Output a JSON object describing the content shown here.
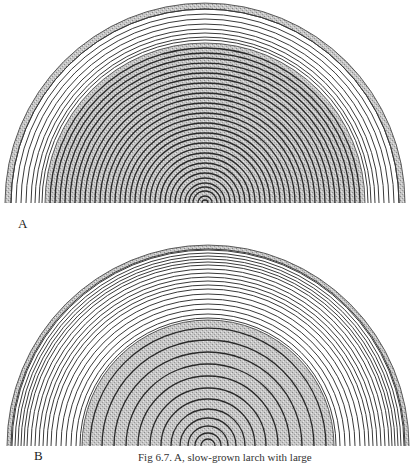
{
  "figure": {
    "caption": "Fig 6.7. A, slow-grown larch with large",
    "panels": [
      {
        "label": "A",
        "description": "slow-grown larch cross-section: wide band of narrow outer rings, stippled core with many closely spaced rings",
        "center": [
          205,
          203
        ],
        "outer_radius": 200,
        "bark_width": 6,
        "stipple_radius": 160,
        "outer_rings": [
          194,
          189,
          184,
          179,
          174,
          170,
          166,
          163
        ],
        "inner_rings": [
          155,
          150,
          145,
          140,
          135,
          130,
          125,
          120,
          115,
          110,
          105,
          100,
          95,
          90,
          85,
          80,
          75,
          70,
          65,
          60,
          55,
          50,
          45,
          40,
          35,
          30,
          25,
          20,
          16,
          12,
          7,
          3
        ]
      },
      {
        "label": "B",
        "description": "larch cross-section: many narrow outer rings, stippled core with widely spaced rings",
        "center": [
          208,
          446
        ],
        "outer_radius": 201,
        "bark_width": 4,
        "stipple_radius": 126,
        "outer_rings": [
          196,
          193,
          190,
          187,
          184,
          181,
          177,
          173,
          169,
          165,
          161,
          157,
          152,
          147,
          142,
          137,
          132,
          128
        ],
        "inner_rings": [
          118,
          106,
          94,
          82,
          70,
          58,
          47,
          37,
          28,
          20,
          13,
          7
        ]
      }
    ]
  },
  "colors": {
    "stipple": "#bdbdbd",
    "bark": "#9a9a9a",
    "ring_line": "#3a3a3a",
    "inner_ring_line": "#2a2a2a",
    "background": "#ffffff"
  }
}
